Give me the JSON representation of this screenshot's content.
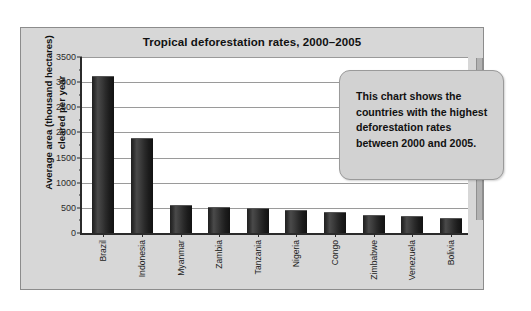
{
  "chart_data": {
    "type": "bar",
    "title": "Tropical deforestation rates, 2000–2005",
    "xlabel": "",
    "ylabel": "Average area (thousand hectares)\ncleared per year",
    "categories": [
      "Brazil",
      "Indonesia",
      "Myanmar",
      "Zambia",
      "Tanzania",
      "Nigeria",
      "Congo",
      "Zimbabwe",
      "Venezuela",
      "Bolivia"
    ],
    "values": [
      3100,
      1870,
      540,
      500,
      480,
      445,
      390,
      335,
      310,
      280
    ],
    "ylim": [
      0,
      3500
    ],
    "ytick_labels": [
      "0",
      "500",
      "1000",
      "1500",
      "2000",
      "2500",
      "3000",
      "3500"
    ],
    "ytick_values": [
      0,
      500,
      1000,
      1500,
      2000,
      2500,
      3000,
      3500
    ],
    "grid": true,
    "legend": "none",
    "bar_color": "#2b2b2b",
    "plot_background": "#ffffff",
    "panel_background": "#d7d7d7",
    "annotations": [
      {
        "name": "callout",
        "text": "This chart shows the\ncountries with the highest\ndeforestation rates\nbetween 2000 and 2005."
      }
    ]
  }
}
